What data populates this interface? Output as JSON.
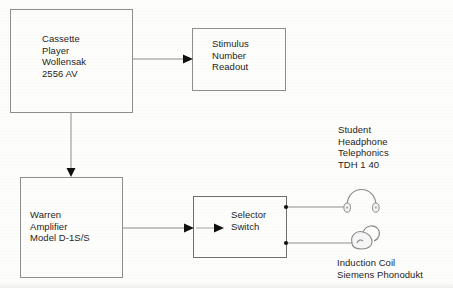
{
  "diagram": {
    "background_color": "#fdfdfb",
    "line_color": "#8a8a8a",
    "text_color": "#1d1d1d",
    "nodes": [
      {
        "id": "cassette-player",
        "label": "Cassette\nPlayer\nWollensak\n2556 AV",
        "shape": "rectangle",
        "x": 10,
        "y": 9,
        "width": 122,
        "height": 103
      },
      {
        "id": "stimulus-readout",
        "label": "Stimulus\nNumber\nReadout",
        "shape": "rectangle",
        "x": 192,
        "y": 28,
        "width": 93,
        "height": 62
      },
      {
        "id": "warren-amplifier",
        "label": "Warren\nAmplifier\nModel D-1S/S",
        "shape": "rectangle",
        "x": 20,
        "y": 177,
        "width": 102,
        "height": 100
      },
      {
        "id": "selector-switch",
        "label": "Selector\nSwitch",
        "shape": "rectangle",
        "x": 193,
        "y": 196,
        "width": 93,
        "height": 61
      }
    ],
    "icons": [
      {
        "id": "headphone",
        "name": "headphone-icon",
        "caption": "Student\nHeadphone\nTelephonics\nTDH 1 40",
        "x": 340,
        "y": 178
      },
      {
        "id": "induction-coil",
        "name": "induction-coil-icon",
        "caption": "Induction Coil\nSiemens Phonodukt",
        "x": 340,
        "y": 226
      }
    ],
    "connections": [
      {
        "from": "cassette-player",
        "to": "stimulus-readout",
        "style": "arrow",
        "direction": "right"
      },
      {
        "from": "cassette-player",
        "to": "warren-amplifier",
        "style": "arrow",
        "direction": "down"
      },
      {
        "from": "warren-amplifier",
        "to": "selector-switch",
        "style": "arrow",
        "direction": "right"
      },
      {
        "from": "selector-switch",
        "to": "headphone",
        "style": "line",
        "terminal": "dot"
      },
      {
        "from": "selector-switch",
        "to": "induction-coil",
        "style": "line",
        "terminal": "dot"
      }
    ]
  },
  "labels": {
    "cassette_player": "Cassette\nPlayer\nWollensak\n2556 AV",
    "stimulus_readout": "Stimulus\nNumber\nReadout",
    "warren_amplifier": "Warren\nAmplifier\nModel D-1S/S",
    "selector_switch": "Selector\nSwitch",
    "headphone_caption": "Student\nHeadphone\nTelephonics\nTDH 1 40",
    "induction_caption": "Induction Coil\nSiemens Phonodukt"
  }
}
